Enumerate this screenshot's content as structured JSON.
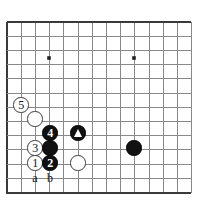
{
  "figure": {
    "name": "go-board-diagram",
    "board_type": "go",
    "visible_columns": 13,
    "visible_rows": 13,
    "corner": "bottom-left",
    "background_color": "#ffffff",
    "line_color": "#888888",
    "edge_line_color": "#3a3a3a",
    "black_color": "#111111",
    "white_color": "#ffffff",
    "grid": {
      "origin_x": 7,
      "origin_y": 22,
      "spacing": 14.2,
      "edge_left_x": 7,
      "edge_top_y": 22,
      "edge_right_x": 191,
      "edge_bottom_y": 193
    },
    "star_points": [
      {
        "name": "star-point-left",
        "x": 49,
        "y": 58
      },
      {
        "name": "star-point-right",
        "x": 134,
        "y": 58
      }
    ],
    "stones": [
      {
        "name": "stone-white-5",
        "color": "white",
        "label": "5",
        "x": 21,
        "y": 105,
        "r": 7.6
      },
      {
        "name": "stone-white-plain-upper",
        "color": "white",
        "label": "",
        "x": 35,
        "y": 119,
        "r": 7.6
      },
      {
        "name": "stone-black-4",
        "color": "black",
        "label": "4",
        "x": 50,
        "y": 133,
        "r": 7.6
      },
      {
        "name": "stone-black-triangle",
        "color": "black",
        "label": "",
        "x": 78,
        "y": 133,
        "r": 7.6,
        "marker": "triangle"
      },
      {
        "name": "stone-white-3",
        "color": "white",
        "label": "3",
        "x": 35,
        "y": 148,
        "r": 7.6
      },
      {
        "name": "stone-black-plain-middle",
        "color": "black",
        "label": "",
        "x": 50,
        "y": 148,
        "r": 7.6
      },
      {
        "name": "stone-black-plain-right",
        "color": "black",
        "label": "",
        "x": 134,
        "y": 148,
        "r": 7.6
      },
      {
        "name": "stone-white-1",
        "color": "white",
        "label": "1",
        "x": 35,
        "y": 163,
        "r": 7.6
      },
      {
        "name": "stone-black-2",
        "color": "black",
        "label": "2",
        "x": 50,
        "y": 163,
        "r": 7.6
      },
      {
        "name": "stone-white-plain-lower",
        "color": "white",
        "label": "",
        "x": 78,
        "y": 163,
        "r": 7.6
      }
    ],
    "point_labels": [
      {
        "name": "point-label-a",
        "text": "a",
        "x": 35,
        "y": 178
      },
      {
        "name": "point-label-b",
        "text": "b",
        "x": 50,
        "y": 178
      }
    ]
  }
}
